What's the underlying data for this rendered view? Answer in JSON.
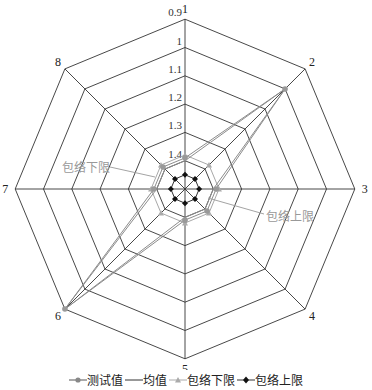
{
  "chart_data": {
    "type": "radar",
    "title": "",
    "axes": [
      "1",
      "2",
      "3",
      "4",
      "5",
      "6",
      "7",
      "8"
    ],
    "radial_ticks": [
      "0.9",
      "1",
      "1.1",
      "1.2",
      "1.3",
      "1.4",
      "1.5"
    ],
    "radial_range": [
      1.5,
      0.9
    ],
    "radial_reversed": true,
    "series": [
      {
        "name": "测试值",
        "color": "#8c8c8c",
        "marker": "circle",
        "values": [
          1.39,
          1.0,
          1.39,
          1.39,
          1.39,
          0.9,
          1.39,
          1.39
        ]
      },
      {
        "name": "均值",
        "color": "#8c8c8c",
        "marker": "none",
        "values": [
          1.4,
          1.0,
          1.4,
          1.4,
          1.4,
          0.9,
          1.4,
          1.4
        ]
      },
      {
        "name": "包络下限",
        "color": "#a8a8a8",
        "marker": "triangle",
        "values": [
          1.38,
          1.38,
          1.38,
          1.38,
          1.38,
          1.38,
          1.38,
          1.38
        ]
      },
      {
        "name": "包络上限",
        "color": "#1a1a1a",
        "marker": "diamond",
        "values": [
          1.45,
          1.45,
          1.45,
          1.45,
          1.45,
          1.45,
          1.45,
          1.45
        ]
      }
    ],
    "annotations": [
      {
        "text": "包络下限",
        "points_to": "envelope-lower"
      },
      {
        "text": "包络上限",
        "points_to": "envelope-upper"
      }
    ],
    "grid": true,
    "legend_position": "bottom"
  },
  "legend": {
    "items": [
      "测试值",
      "均值",
      "包络下限",
      "包络上限"
    ]
  },
  "annotations": {
    "lower": "包络下限",
    "upper": "包络上限"
  }
}
